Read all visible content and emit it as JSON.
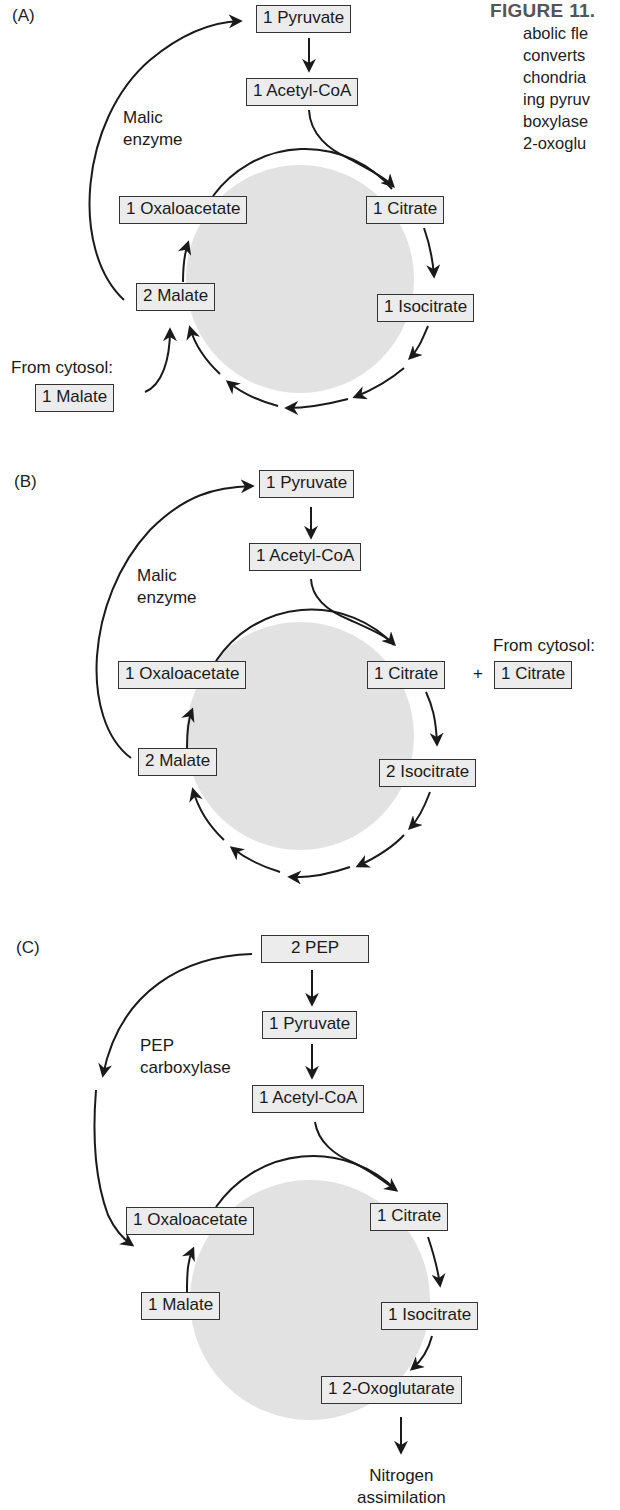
{
  "caption": {
    "heading": "FIGURE 11.",
    "lines": [
      "abolic fle",
      "converts",
      "chondria",
      "ing pyruv",
      "boxylase",
      "2-oxoglu"
    ]
  },
  "panels": [
    {
      "label": "(A)",
      "enzyme_label": [
        "Malic",
        "enzyme"
      ],
      "boxes": {
        "pyruvate": "1 Pyruvate",
        "acetyl_coa": "1 Acetyl-CoA",
        "oxaloacetate": "1 Oxaloacetate",
        "citrate": "1 Citrate",
        "malate": "2 Malate",
        "isocitrate": "1 Isocitrate",
        "cytosol_malate": "1 Malate"
      },
      "cytosol_label": "From cytosol:"
    },
    {
      "label": "(B)",
      "enzyme_label": [
        "Malic",
        "enzyme"
      ],
      "boxes": {
        "pyruvate": "1 Pyruvate",
        "acetyl_coa": "1 Acetyl-CoA",
        "oxaloacetate": "1 Oxaloacetate",
        "citrate": "1 Citrate",
        "cytosol_citrate": "1 Citrate",
        "malate": "2 Malate",
        "isocitrate": "2 Isocitrate"
      },
      "plus": "+",
      "cytosol_label": "From cytosol:"
    },
    {
      "label": "(C)",
      "enzyme_label": [
        "PEP",
        "carboxylase"
      ],
      "boxes": {
        "pep": "2 PEP",
        "pyruvate": "1 Pyruvate",
        "acetyl_coa": "1 Acetyl-CoA",
        "oxaloacetate": "1 Oxaloacetate",
        "citrate": "1 Citrate",
        "malate": "1 Malate",
        "isocitrate": "1 Isocitrate",
        "oxoglutarate": "1 2-Oxoglutarate"
      },
      "output_label": [
        "Nitrogen",
        "assimilation"
      ]
    }
  ],
  "colors": {
    "cycle_fill": "#e2e2e2",
    "box_fill": "#ececec",
    "stroke": "#1a1a1a"
  }
}
